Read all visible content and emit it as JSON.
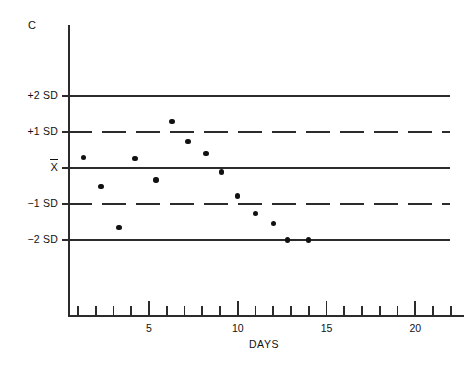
{
  "chart_data": {
    "type": "scatter",
    "title": "",
    "panel_label": "C",
    "xlabel": "DAYS",
    "ylabel": "",
    "xlim": [
      0,
      22.3
    ],
    "ylim": [
      -3.2,
      3.6
    ],
    "grid": false,
    "legend": "none",
    "x_tick_labels": [
      "5",
      "10",
      "15",
      "20"
    ],
    "x_tick_values": [
      5,
      10,
      15,
      20
    ],
    "x_minor_ticks": [
      1,
      2,
      3,
      4,
      6,
      7,
      8,
      9,
      11,
      12,
      13,
      14,
      16,
      17,
      18,
      19,
      21,
      22
    ],
    "y_tick_labels": [
      "+2 SD",
      "+1 SD",
      "X̄",
      "-1 SD",
      "-2 SD"
    ],
    "y_tick_values": [
      2,
      1,
      0,
      -1,
      -2
    ],
    "reference_lines": [
      {
        "label": "+2 SD",
        "value": 2,
        "style": "solid"
      },
      {
        "label": "+1 SD",
        "value": 1,
        "style": "dashed"
      },
      {
        "label": "X̄",
        "value": 0,
        "style": "solid"
      },
      {
        "label": "-1 SD",
        "value": -1,
        "style": "dashed"
      },
      {
        "label": "-2 SD",
        "value": -2,
        "style": "solid"
      }
    ],
    "x": [
      1.3,
      2.3,
      3.3,
      4.2,
      5.4,
      6.3,
      7.2,
      8.2,
      9.1,
      10.0,
      11.0,
      12.0,
      12.8,
      14.0
    ],
    "values": [
      0.3,
      -0.52,
      -1.65,
      0.27,
      -0.33,
      1.3,
      0.73,
      0.4,
      -0.11,
      -0.78,
      -1.27,
      -1.54,
      -2.0,
      -2.0
    ],
    "points": [
      {
        "x": 1.3,
        "y": 0.3
      },
      {
        "x": 2.3,
        "y": -0.52
      },
      {
        "x": 3.3,
        "y": -1.65
      },
      {
        "x": 4.2,
        "y": 0.27
      },
      {
        "x": 5.4,
        "y": -0.33
      },
      {
        "x": 6.3,
        "y": 1.3
      },
      {
        "x": 7.2,
        "y": 0.73
      },
      {
        "x": 8.2,
        "y": 0.4
      },
      {
        "x": 9.1,
        "y": -0.11
      },
      {
        "x": 10.0,
        "y": -0.78
      },
      {
        "x": 11.0,
        "y": -1.27
      },
      {
        "x": 12.0,
        "y": -1.54
      },
      {
        "x": 12.8,
        "y": -2.0
      },
      {
        "x": 14.0,
        "y": -2.0
      }
    ]
  },
  "axis": {
    "corner_label": "C",
    "x_title": "DAYS"
  },
  "colors": {
    "line": "#2b2b2b",
    "point": "#111111",
    "background": "#ffffff"
  }
}
